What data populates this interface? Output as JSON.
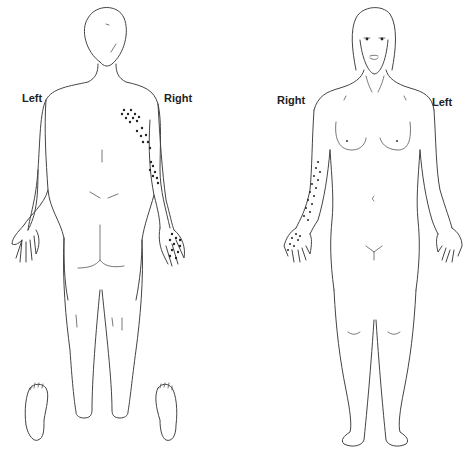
{
  "diagram": {
    "type": "body-chart",
    "views": [
      {
        "name": "posterior",
        "labels": {
          "left": "Left",
          "right": "Right"
        },
        "marked_regions": [
          "right upper arm (posterior)",
          "right forearm (posterior)",
          "right hand (dorsal)"
        ]
      },
      {
        "name": "anterior",
        "labels": {
          "left": "Left",
          "right": "Right"
        },
        "marked_regions": [
          "right forearm (anterior)",
          "right palm"
        ]
      }
    ],
    "extras": [
      "left sole",
      "right sole"
    ],
    "colors": {
      "line": "#444444",
      "dot": "#222222",
      "background": "#ffffff"
    }
  }
}
